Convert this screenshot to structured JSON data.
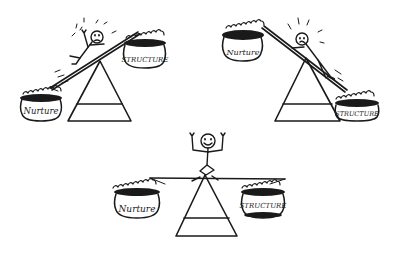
{
  "illustration": {
    "description": "Three hand-drawn balance scales comparing Nurture and Structure",
    "ink_color": "#1a1a1a",
    "background": "#ffffff",
    "scales": [
      {
        "id": "left-heavy-nurture",
        "position": "top-left",
        "state": "tipped toward Nurture; stick figure sliding down, distressed",
        "left_pot": {
          "label": "Nurture",
          "position": "low"
        },
        "right_pot": {
          "label": "STRUCTURE",
          "position": "high"
        },
        "figure_mood": "upset"
      },
      {
        "id": "right-heavy-structure",
        "position": "top-right",
        "state": "tipped toward Structure; stick figure sliding down, distressed",
        "left_pot": {
          "label": "Nurture",
          "position": "high"
        },
        "right_pot": {
          "label": "STRUCTURE",
          "position": "low"
        },
        "figure_mood": "upset"
      },
      {
        "id": "balanced",
        "position": "bottom-center",
        "state": "balanced; stick figure sitting on top, arms raised, smiling",
        "left_pot": {
          "label": "Nurture",
          "position": "level"
        },
        "right_pot": {
          "label": "STRUCTURE",
          "position": "level"
        },
        "figure_mood": "happy"
      }
    ]
  }
}
